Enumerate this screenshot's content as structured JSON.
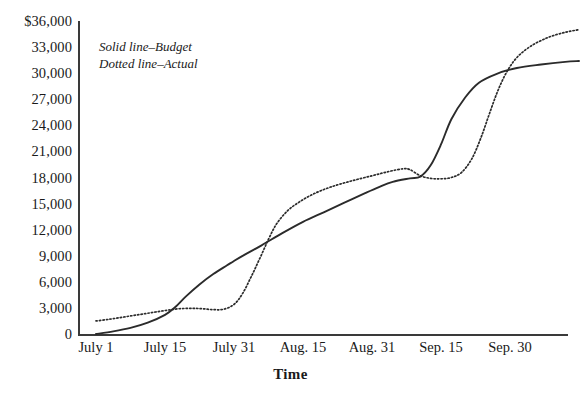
{
  "chart_data": {
    "type": "line",
    "title": "",
    "subtitle": "",
    "xlabel": "Time",
    "ylabel": "",
    "grid": false,
    "legend_position": "inside-top-left",
    "xlim": [
      0,
      7
    ],
    "ylim": [
      0,
      36000
    ],
    "y_ticks": [
      36000,
      33000,
      30000,
      27000,
      24000,
      21000,
      18000,
      15000,
      12000,
      9000,
      6000,
      3000,
      0
    ],
    "y_tick_labels": [
      "$36,000",
      "33,000",
      "30,000",
      "27,000",
      "24,000",
      "21,000",
      "18,000",
      "15,000",
      "12,000",
      "9,000",
      "6,000",
      "3,000",
      "0"
    ],
    "categories": [
      "July 1",
      "July 15",
      "July 31",
      "Aug. 15",
      "Aug. 31",
      "Sep. 15",
      "Sep. 30"
    ],
    "x_tick_labels": [
      "July 1",
      "July 15",
      "July 31",
      "Aug. 15",
      "Aug. 31",
      "Sep. 15",
      "Sep. 30"
    ],
    "legend_entries": [
      "Solid line–Budget",
      "Dotted line–Actual"
    ],
    "series": [
      {
        "name": "Budget",
        "style": "solid",
        "color": "#2b2b2b",
        "points": [
          [
            0.0,
            0
          ],
          [
            0.25,
            300
          ],
          [
            0.5,
            700
          ],
          [
            0.75,
            1300
          ],
          [
            1.0,
            2200
          ],
          [
            1.15,
            3100
          ],
          [
            1.3,
            4300
          ],
          [
            1.5,
            5700
          ],
          [
            1.7,
            6900
          ],
          [
            1.9,
            7900
          ],
          [
            2.0,
            8400
          ],
          [
            2.15,
            9100
          ],
          [
            2.4,
            10200
          ],
          [
            2.7,
            11600
          ],
          [
            3.0,
            12900
          ],
          [
            3.3,
            14000
          ],
          [
            3.6,
            15100
          ],
          [
            3.9,
            16200
          ],
          [
            4.1,
            16900
          ],
          [
            4.3,
            17500
          ],
          [
            4.55,
            17900
          ],
          [
            4.7,
            18100
          ],
          [
            4.85,
            19400
          ],
          [
            5.0,
            21800
          ],
          [
            5.15,
            24700
          ],
          [
            5.35,
            27200
          ],
          [
            5.55,
            28900
          ],
          [
            5.8,
            29900
          ],
          [
            6.1,
            30600
          ],
          [
            6.45,
            31000
          ],
          [
            6.8,
            31300
          ],
          [
            7.0,
            31400
          ]
        ]
      },
      {
        "name": "Actual",
        "style": "dotted",
        "color": "#2b2b2b",
        "points": [
          [
            0.0,
            1500
          ],
          [
            0.2,
            1700
          ],
          [
            0.4,
            1950
          ],
          [
            0.6,
            2200
          ],
          [
            0.8,
            2450
          ],
          [
            1.0,
            2700
          ],
          [
            1.2,
            2900
          ],
          [
            1.4,
            2950
          ],
          [
            1.55,
            2900
          ],
          [
            1.7,
            2800
          ],
          [
            1.85,
            2850
          ],
          [
            2.0,
            3400
          ],
          [
            2.12,
            4600
          ],
          [
            2.25,
            6600
          ],
          [
            2.38,
            8800
          ],
          [
            2.5,
            10900
          ],
          [
            2.62,
            12700
          ],
          [
            2.78,
            14200
          ],
          [
            2.95,
            15200
          ],
          [
            3.15,
            16100
          ],
          [
            3.4,
            16900
          ],
          [
            3.7,
            17600
          ],
          [
            4.0,
            18200
          ],
          [
            4.25,
            18700
          ],
          [
            4.45,
            19000
          ],
          [
            4.55,
            18900
          ],
          [
            4.7,
            18200
          ],
          [
            4.85,
            17900
          ],
          [
            5.0,
            17850
          ],
          [
            5.15,
            18000
          ],
          [
            5.3,
            18600
          ],
          [
            5.45,
            20200
          ],
          [
            5.58,
            22600
          ],
          [
            5.7,
            25300
          ],
          [
            5.82,
            27900
          ],
          [
            5.95,
            30100
          ],
          [
            6.1,
            31800
          ],
          [
            6.3,
            33100
          ],
          [
            6.55,
            34100
          ],
          [
            6.8,
            34700
          ],
          [
            7.0,
            35000
          ]
        ]
      }
    ]
  },
  "layout": {
    "plot_left_px": 78,
    "plot_right_px": 568,
    "plot_top_px": 21,
    "plot_bottom_px": 334,
    "y_top_value": 36000,
    "y_bottom_value": 0,
    "x_first_tick_px": 96,
    "x_tick_spacing_px": 69
  }
}
